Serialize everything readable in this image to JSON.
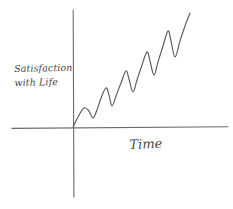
{
  "chart_data": {
    "type": "line",
    "title": "",
    "subtitle": "",
    "style": "hand-drawn sketch",
    "xlabel": "Time",
    "ylabel": "Satisfaction with Life",
    "ylabel_line1": "Satisfaction",
    "ylabel_line2": "with Life",
    "tick_labels_x": [],
    "tick_labels_y": [],
    "grid": false,
    "legend": null,
    "annotations": [],
    "axis_color": "#6b6b6b",
    "curve_color": "#5a5a5a",
    "background_color": "#ffffff",
    "axes": {
      "x_axis": {
        "x1": 12,
        "y1": 128,
        "x2": 228,
        "y2": 127
      },
      "y_axis": {
        "x1": 73,
        "y1": 10,
        "x2": 74,
        "y2": 197
      }
    },
    "series": [
      {
        "name": "Satisfaction with Life",
        "points": [
          [
            73,
            127
          ],
          [
            78,
            117
          ],
          [
            84,
            108
          ],
          [
            89,
            111
          ],
          [
            93,
            118
          ],
          [
            97,
            110
          ],
          [
            101,
            98
          ],
          [
            106,
            88
          ],
          [
            109,
            95
          ],
          [
            112,
            106
          ],
          [
            116,
            96
          ],
          [
            121,
            83
          ],
          [
            126,
            71
          ],
          [
            129,
            79
          ],
          [
            133,
            92
          ],
          [
            137,
            80
          ],
          [
            142,
            65
          ],
          [
            147,
            52
          ],
          [
            150,
            61
          ],
          [
            154,
            75
          ],
          [
            158,
            62
          ],
          [
            163,
            46
          ],
          [
            168,
            31
          ],
          [
            171,
            41
          ],
          [
            175,
            57
          ],
          [
            180,
            41
          ],
          [
            185,
            26
          ],
          [
            190,
            13
          ]
        ],
        "cycles": 5,
        "trend": "increasing",
        "pattern": "sawtooth"
      }
    ],
    "xlim_px": [
      12,
      228
    ],
    "ylim_px": [
      10,
      197
    ]
  }
}
